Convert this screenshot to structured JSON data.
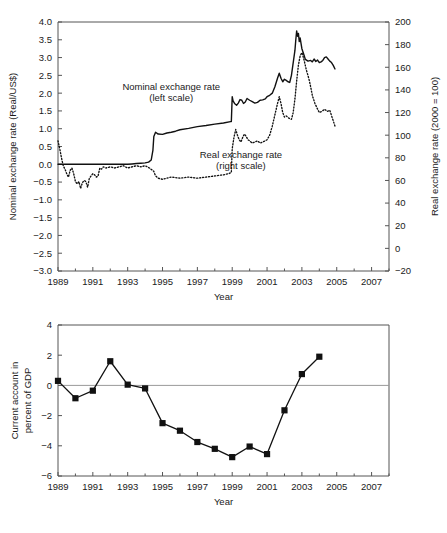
{
  "figure": {
    "panels": [
      "top",
      "bottom"
    ]
  },
  "chart_data": [
    {
      "id": "exchange-rates",
      "type": "line",
      "title": "",
      "xlabel": "Year",
      "ylabel": "Nominal exchange rate (Real/US$)",
      "ylabel_right": "Real exchange rate (2000 = 100)",
      "grid": false,
      "legend_position": "inside-annotations",
      "xlim": [
        1989,
        2008
      ],
      "xticks": [
        1989,
        1991,
        1993,
        1995,
        1997,
        1999,
        2001,
        2003,
        2005,
        2007
      ],
      "xticklabels": [
        "1989",
        "1991",
        "1993",
        "1995",
        "1997",
        "1999",
        "2001",
        "2003",
        "2005",
        "2007"
      ],
      "xminorticks": [
        1990,
        1992,
        1994,
        1996,
        1998,
        2000,
        2002,
        2004,
        2006,
        2008
      ],
      "ylim": [
        -3.0,
        4.0
      ],
      "yticks": [
        -3.0,
        -2.5,
        -2.0,
        -1.5,
        -1.0,
        -0.5,
        0.0,
        0.5,
        1.0,
        1.5,
        2.0,
        2.5,
        3.0,
        3.5,
        4.0
      ],
      "yticklabels": [
        "−3.0",
        "−2.5",
        "−2.0",
        "−1.5",
        "−1.0",
        "−0.5",
        "0.0",
        "0.5",
        "1.0",
        "1.5",
        "2.0",
        "2.5",
        "3.0",
        "3.5",
        "4.0"
      ],
      "ylim_right": [
        -20,
        200
      ],
      "yticks_right": [
        -20,
        0,
        20,
        40,
        60,
        80,
        100,
        120,
        140,
        160,
        180,
        200
      ],
      "yticklabels_right": [
        "−20",
        "0",
        "20",
        "40",
        "60",
        "80",
        "100",
        "120",
        "140",
        "160",
        "180",
        "200"
      ],
      "annotations": [
        {
          "text": "Nominal exchange rate",
          "x": 1995.5,
          "y": 2.1,
          "name": "nominal-series-label-line1"
        },
        {
          "text": "(left scale)",
          "x": 1995.5,
          "y": 1.78,
          "name": "nominal-series-label-line2"
        },
        {
          "text": "Real exchange rate",
          "x": 1999.5,
          "y": 0.18,
          "name": "real-series-label-line1"
        },
        {
          "text": "(right scale)",
          "x": 1999.5,
          "y": -0.14,
          "name": "real-series-label-line2"
        }
      ],
      "series": [
        {
          "name": "Nominal exchange rate (left scale)",
          "axis": "left",
          "style": "solid",
          "x": [
            1989.0,
            1989.5,
            1990.0,
            1990.5,
            1991.0,
            1991.5,
            1992.0,
            1992.5,
            1993.0,
            1993.25,
            1993.5,
            1993.75,
            1994.0,
            1994.2,
            1994.35,
            1994.45,
            1994.5,
            1994.6,
            1994.75,
            1995.0,
            1995.25,
            1995.5,
            1995.75,
            1996.0,
            1996.5,
            1997.0,
            1997.5,
            1998.0,
            1998.5,
            1998.9,
            1998.95,
            1999.0,
            1999.05,
            1999.15,
            1999.25,
            1999.35,
            1999.45,
            1999.55,
            1999.65,
            1999.75,
            1999.85,
            2000.0,
            2000.15,
            2000.3,
            2000.45,
            2000.6,
            2000.75,
            2000.9,
            2001.0,
            2001.15,
            2001.3,
            2001.45,
            2001.6,
            2001.7,
            2001.8,
            2001.9,
            2002.0,
            2002.1,
            2002.2,
            2002.3,
            2002.4,
            2002.5,
            2002.6,
            2002.65,
            2002.7,
            2002.75,
            2002.8,
            2002.85,
            2002.9,
            2002.95,
            2003.0,
            2003.1,
            2003.2,
            2003.35,
            2003.5,
            2003.6,
            2003.7,
            2003.8,
            2003.9,
            2004.0,
            2004.1,
            2004.2,
            2004.3,
            2004.4,
            2004.5,
            2004.6,
            2004.7,
            2004.8,
            2004.9
          ],
          "y": [
            0.0,
            0.0,
            0.0,
            0.0,
            0.0,
            0.0,
            0.0,
            0.0,
            0.0,
            0.01,
            0.02,
            0.03,
            0.04,
            0.06,
            0.12,
            0.4,
            0.78,
            0.9,
            0.85,
            0.84,
            0.88,
            0.9,
            0.93,
            0.97,
            1.01,
            1.06,
            1.09,
            1.13,
            1.16,
            1.2,
            1.2,
            1.9,
            1.78,
            1.7,
            1.66,
            1.72,
            1.82,
            1.8,
            1.71,
            1.75,
            1.85,
            1.8,
            1.76,
            1.72,
            1.74,
            1.8,
            1.81,
            1.84,
            1.9,
            1.94,
            2.0,
            2.18,
            2.42,
            2.56,
            2.42,
            2.32,
            2.39,
            2.36,
            2.32,
            2.3,
            2.5,
            2.85,
            3.2,
            3.5,
            3.75,
            3.6,
            3.68,
            3.45,
            3.55,
            3.4,
            3.25,
            3.1,
            2.95,
            2.9,
            2.92,
            2.88,
            2.96,
            2.89,
            2.93,
            2.86,
            2.88,
            2.92,
            3.0,
            3.02,
            2.96,
            2.9,
            2.86,
            2.78,
            2.68
          ]
        },
        {
          "name": "Real exchange rate (right scale)",
          "axis": "right",
          "style": "dotted",
          "x": [
            1989.0,
            1989.1,
            1989.2,
            1989.3,
            1989.4,
            1989.5,
            1989.6,
            1989.7,
            1989.8,
            1989.9,
            1990.0,
            1990.1,
            1990.2,
            1990.3,
            1990.4,
            1990.5,
            1990.6,
            1990.7,
            1990.8,
            1990.9,
            1991.0,
            1991.1,
            1991.2,
            1991.3,
            1991.4,
            1991.5,
            1991.6,
            1991.75,
            1992.0,
            1992.25,
            1992.5,
            1992.75,
            1993.0,
            1993.25,
            1993.5,
            1993.75,
            1994.0,
            1994.25,
            1994.5,
            1994.6,
            1994.75,
            1995.0,
            1995.25,
            1995.5,
            1996.0,
            1996.5,
            1997.0,
            1997.5,
            1998.0,
            1998.5,
            1998.8,
            1998.95,
            1999.0,
            1999.1,
            1999.2,
            1999.3,
            1999.4,
            1999.5,
            1999.6,
            1999.7,
            1999.8,
            1999.9,
            2000.0,
            2000.15,
            2000.3,
            2000.45,
            2000.6,
            2000.75,
            2000.9,
            2001.0,
            2001.15,
            2001.3,
            2001.45,
            2001.6,
            2001.7,
            2001.8,
            2001.9,
            2002.0,
            2002.1,
            2002.25,
            2002.4,
            2002.5,
            2002.6,
            2002.7,
            2002.8,
            2002.9,
            2003.0,
            2003.1,
            2003.25,
            2003.4,
            2003.5,
            2003.6,
            2003.75,
            2003.9,
            2004.0,
            2004.15,
            2004.3,
            2004.45,
            2004.6,
            2004.75,
            2004.9
          ],
          "y": [
            95.0,
            88.0,
            80.0,
            73.0,
            70.0,
            66.0,
            63.0,
            69.0,
            71.0,
            66.0,
            59.0,
            57.0,
            59.0,
            53.0,
            58.0,
            60.0,
            59.0,
            54.0,
            62.0,
            64.0,
            66.0,
            65.0,
            63.0,
            64.0,
            71.0,
            70.0,
            72.0,
            71.0,
            72.0,
            71.0,
            72.0,
            73.0,
            71.0,
            72.0,
            73.0,
            72.0,
            73.0,
            71.0,
            68.0,
            64.0,
            62.0,
            61.0,
            62.0,
            63.0,
            62.0,
            63.0,
            62.0,
            63.0,
            64.0,
            65.0,
            66.0,
            67.0,
            88.0,
            98.0,
            105.0,
            100.0,
            96.0,
            94.0,
            98.0,
            101.0,
            99.0,
            96.0,
            95.0,
            93.0,
            94.0,
            95.0,
            93.0,
            94.0,
            95.0,
            96.0,
            100.0,
            108.0,
            118.0,
            128.0,
            134.0,
            128.0,
            120.0,
            116.0,
            117.0,
            115.0,
            114.0,
            120.0,
            132.0,
            148.0,
            162.0,
            170.0,
            173.0,
            168.0,
            158.0,
            150.0,
            143.0,
            135.0,
            128.0,
            123.0,
            120.0,
            121.0,
            123.0,
            121.0,
            122.0,
            115.0,
            108.0
          ]
        }
      ]
    },
    {
      "id": "current-account",
      "type": "line",
      "title": "",
      "xlabel": "Year",
      "ylabel": "Current account in percent of GDP",
      "grid": false,
      "legend_position": "none",
      "xlim": [
        1989,
        2008
      ],
      "xticks": [
        1989,
        1991,
        1993,
        1995,
        1997,
        1999,
        2001,
        2003,
        2005,
        2007
      ],
      "xticklabels": [
        "1989",
        "1991",
        "1993",
        "1995",
        "1997",
        "1999",
        "2001",
        "2003",
        "2005",
        "2007"
      ],
      "xminorticks": [
        1990,
        1992,
        1994,
        1996,
        1998,
        2000,
        2002,
        2004,
        2006,
        2008
      ],
      "ylim": [
        -6,
        4
      ],
      "yticks": [
        -6,
        -4,
        -2,
        0,
        2,
        4
      ],
      "yticklabels": [
        "−6",
        "−4",
        "−2",
        "0",
        "2",
        "4"
      ],
      "series": [
        {
          "name": "Current account in percent of GDP",
          "axis": "left",
          "style": "markers",
          "x": [
            1989,
            1990,
            1991,
            1992,
            1993,
            1994,
            1995,
            1996,
            1997,
            1998,
            1999,
            2000,
            2001,
            2002,
            2003,
            2004
          ],
          "y": [
            0.3,
            -0.85,
            -0.35,
            1.6,
            0.05,
            -0.2,
            -2.5,
            -3.0,
            -3.75,
            -4.2,
            -4.75,
            -4.05,
            -4.55,
            -1.65,
            0.75,
            1.9
          ]
        }
      ]
    }
  ]
}
